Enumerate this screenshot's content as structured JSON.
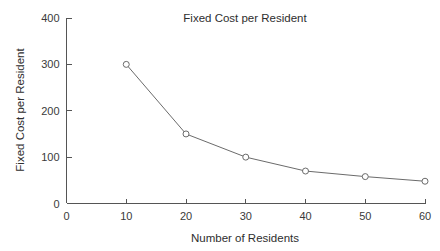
{
  "chart_data": {
    "type": "line",
    "title": "Fixed Cost per Resident",
    "xlabel": "Number of Residents",
    "ylabel": "Fixed Cost per Resident",
    "x": [
      10,
      20,
      30,
      40,
      50,
      60
    ],
    "values": [
      300,
      150,
      100,
      70,
      58,
      48
    ],
    "series": [
      {
        "name": "Fixed Cost per Resident",
        "x": [
          10,
          20,
          30,
          40,
          50,
          60
        ],
        "values": [
          300,
          150,
          100,
          70,
          58,
          48
        ]
      }
    ],
    "xlim": [
      0,
      60
    ],
    "ylim": [
      0,
      400
    ],
    "xticks": [
      0,
      10,
      20,
      30,
      40,
      50,
      60
    ],
    "yticks": [
      0,
      100,
      200,
      300,
      400
    ],
    "xtick_labels": [
      "0",
      "10",
      "20",
      "30",
      "40",
      "50",
      "60"
    ],
    "ytick_labels": [
      "0",
      "100",
      "200",
      "300",
      "400"
    ],
    "grid": false,
    "legend": false,
    "legend_position": "none",
    "marker": "open-circle",
    "colors": {
      "background": "#ffffff",
      "line": "#6b6b6b",
      "axis": "#555555",
      "text": "#2e2e2e",
      "marker_fill": "#ffffff"
    }
  }
}
